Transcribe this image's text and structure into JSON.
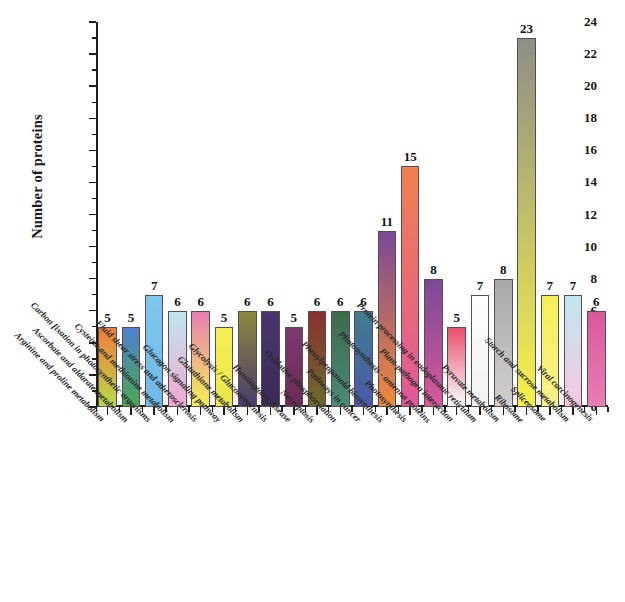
{
  "chart_data": {
    "type": "bar",
    "title": "",
    "subtitle": "",
    "xlabel": "",
    "ylabel": "Number of proteins",
    "ylim": [
      0,
      24
    ],
    "ytick_step": 2,
    "minor_ticks": true,
    "grid": false,
    "legend": "none",
    "value_labels_shown": true,
    "categories": [
      "Arginine and proline metabolism",
      "Ascorbate and aldarate metabolism",
      "Carbon fixation in photosynthetic organisms",
      "Cysteine and methionine metabolism",
      "Fluid shear stress and atherosclerosis",
      "Glucagon signaling pathway",
      "Glutathione metabolism",
      "Glycolysis / Gluconeogenesis",
      "Huntington's disease",
      "Necroptosis",
      "Oxidative phosphorylation",
      "Pathways in cancer",
      "Phenylpropanoid biosynthesis",
      "Photosynthesis",
      "Photosynthesis - antenna proteins",
      "Plant-pathogen interaction",
      "Protein processing in endoplasmic reticulum",
      "Pyruvate metabolism",
      "Ribosome",
      "Spliceosome",
      "Starch and sucrose metabolism",
      "Viral carcinogenesis"
    ],
    "values": [
      5,
      5,
      7,
      6,
      6,
      5,
      6,
      6,
      5,
      6,
      6,
      6,
      11,
      15,
      8,
      5,
      7,
      8,
      23,
      7,
      7,
      6
    ],
    "ytick_labels": [
      "0",
      "2",
      "4",
      "6",
      "8",
      "10",
      "12",
      "14",
      "16",
      "18",
      "20",
      "22",
      "24"
    ],
    "bar_colors_top": [
      "#ef7d3a",
      "#4f7fd0",
      "#7fc7ef",
      "#bfe6ef",
      "#e87fb4",
      "#f4ef56",
      "#8c8a3c",
      "#4a3570",
      "#7a3a6e",
      "#8a3030",
      "#3d6b4a",
      "#3f7c92",
      "#7c4a96",
      "#f08050",
      "#7a4a96",
      "#e8506e",
      "#fdfdfd",
      "#a8a8a8",
      "#8e8e86",
      "#f4ef56",
      "#bfe6ef",
      "#d9589a"
    ],
    "bar_colors_bottom": [
      "#b9d94a",
      "#4aa84f",
      "#6fb9e8",
      "#f0a8d0",
      "#f4ef56",
      "#eae64a",
      "#4a3a6e",
      "#3a2a56",
      "#6e2a56",
      "#6e6a2a",
      "#4a8a7a",
      "#4a5aa8",
      "#ef8a3a",
      "#e0589a",
      "#d9589a",
      "#fdfdfd",
      "#f2f2f2",
      "#cfcfcf",
      "#f7f24a",
      "#f7f28a",
      "#f6c8e0",
      "#e87fb4"
    ]
  }
}
